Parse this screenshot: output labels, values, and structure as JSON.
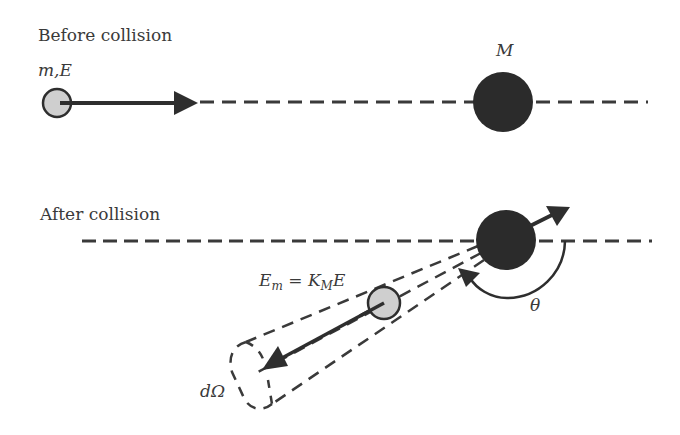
{
  "diagram": {
    "before": {
      "title": "Before collision",
      "projectile_label": "m,E",
      "target_label": "M"
    },
    "after": {
      "title": "After collision",
      "energy_label": {
        "lhs": "E",
        "lhs_sub": "m",
        "equals": " = ",
        "k": "K",
        "k_sub": "M",
        "rhs": "E"
      },
      "angle_label": "θ",
      "solid_angle_label": "dΩ"
    },
    "colors": {
      "projectile_fill": "#cfcfcf",
      "target_fill": "#2b2b2b",
      "stroke": "#2e2e2e",
      "text": "#3a3a3a"
    }
  }
}
